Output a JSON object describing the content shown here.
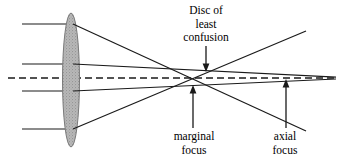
{
  "figure": {
    "type": "optical-ray-diagram",
    "width": 339,
    "height": 163,
    "background_color": "#ffffff",
    "line_color": "#1a1a1a",
    "lens_fill_color": "#b3b3b3",
    "lens_stroke_color": "#6e6e6e"
  },
  "labels": {
    "disc_of_least_confusion": {
      "line1": "Disc of",
      "line2": "least",
      "line3": "confusion"
    },
    "marginal_focus": {
      "line1": "marginal",
      "line2": "focus"
    },
    "axial_focus": {
      "line1": "axial",
      "line2": "focus"
    }
  },
  "elements": {
    "lens": {
      "name": "biconvex-lens",
      "center_x": 71,
      "center_y": 80,
      "half_width": 8,
      "half_height": 67
    },
    "optical_axis": {
      "name": "optical-axis",
      "style": "dashed",
      "y": 78,
      "x_start": 8,
      "x_end": 336
    },
    "incoming_rays": [
      {
        "name": "marginal-ray-upper",
        "y": 24,
        "x_start": 22,
        "x_end": 71
      },
      {
        "name": "paraxial-ray-upper",
        "y": 64,
        "x_start": 22,
        "x_end": 71
      },
      {
        "name": "paraxial-ray-lower",
        "y": 91,
        "x_start": 22,
        "x_end": 71
      },
      {
        "name": "marginal-ray-lower",
        "y": 129,
        "x_start": 22,
        "x_end": 71
      }
    ],
    "refracted_rays": [
      {
        "name": "marginal-ray-upper-refracted",
        "x1": 71,
        "y1": 24,
        "x2": 306,
        "y2": 131
      },
      {
        "name": "paraxial-ray-upper-refracted",
        "x1": 71,
        "y1": 64,
        "x2": 336,
        "y2": 77
      },
      {
        "name": "paraxial-ray-lower-refracted",
        "x1": 71,
        "y1": 91,
        "x2": 336,
        "y2": 79
      },
      {
        "name": "marginal-ray-lower-refracted",
        "x1": 71,
        "y1": 129,
        "x2": 306,
        "y2": 31
      }
    ],
    "pointers": [
      {
        "name": "disc-of-least-confusion-pointer",
        "x": 206,
        "y_start": 46,
        "y_end": 71,
        "direction": "down"
      },
      {
        "name": "marginal-focus-pointer",
        "x": 193,
        "y_start": 128,
        "y_end": 86,
        "direction": "up"
      },
      {
        "name": "axial-focus-pointer",
        "x": 286,
        "y_start": 128,
        "y_end": 80,
        "direction": "up"
      }
    ],
    "focus_points": {
      "marginal_focus_x": 191,
      "disc_of_least_confusion_x": 206,
      "axial_focus_x": 286
    }
  }
}
